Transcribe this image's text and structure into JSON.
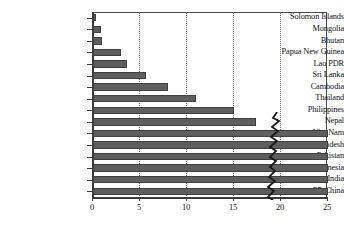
{
  "chart_data": {
    "type": "bar",
    "orientation": "horizontal",
    "title": "",
    "subtitle": "",
    "xlabel": "",
    "ylabel": "",
    "xlim": [
      0,
      25
    ],
    "ylim": null,
    "grid": true,
    "legend": null,
    "legend_position": "none",
    "bar_color": "#5e5e5e",
    "xticks": [
      0,
      5,
      10,
      15,
      20,
      25
    ],
    "xtick_labels": [
      "0",
      "5",
      "10",
      "15",
      "20",
      "25"
    ],
    "categories": [
      "Solomon Islands",
      "Mongolia",
      "Bhutan",
      "Papua New Guinea",
      "Lao PDR",
      "Sri Lanka",
      "Cambodia",
      "Thailand",
      "Philippines",
      "Nepal",
      "Viet Nam",
      "Bangladesh",
      "Pakistan",
      "Indonesia",
      "India",
      "PR China"
    ],
    "values": [
      0.3,
      0.9,
      1.0,
      3.0,
      3.6,
      5.6,
      8.0,
      11.0,
      15.0,
      17.3,
      25.0,
      25.0,
      25.0,
      25.0,
      25.0,
      25.0
    ],
    "truncated_categories": [
      "Viet Nam",
      "Bangladesh",
      "Pakistan",
      "Indonesia",
      "India",
      "PR China"
    ],
    "annotations": [
      {
        "type": "axis-break",
        "label": "zigzag break mark",
        "x_position": 21.5
      }
    ]
  },
  "colors": {
    "bar": "#5e5e5e",
    "bar_edge": "#3f3f3f",
    "axis": "#3a3a3a",
    "grid": "#6d6d6d",
    "text": "#0d0d0d",
    "background": "#ffffff"
  }
}
